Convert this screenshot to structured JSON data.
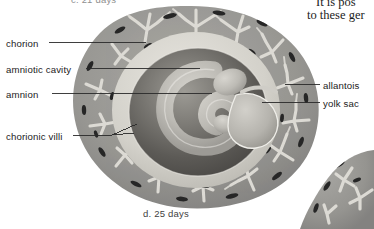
{
  "figure": {
    "caption_top": "c. 21 days",
    "caption_bottom": "d.  25 days",
    "panel_letter": "d",
    "age": "25 days"
  },
  "body_text": {
    "line1": "It is pos",
    "line2": "to these ger"
  },
  "labels": {
    "chorion": "chorion",
    "amniotic_cavity": "amniotic cavity",
    "amnion": "amnion",
    "chorionic_villi": "chorionic villi",
    "allantois": "allantois",
    "yolk_sac": "yolk sac"
  },
  "colors": {
    "background": "#ffffff",
    "chorion_ring": "#9a9a9a",
    "chorion_ring_dark": "#7e7e7e",
    "villi_light": "#d9d9d9",
    "vessel_fleck": "#2b2b2b",
    "amniotic_cavity": "#d5d3cd",
    "amnion_outer": "#8b8b8b",
    "amnion_inner": "#4a4a4a",
    "embryo_light": "#c9c7c1",
    "yolk_sac": "#b9b7b1",
    "leader_line": "#2a2a2a",
    "text": "#1b1b1b"
  }
}
